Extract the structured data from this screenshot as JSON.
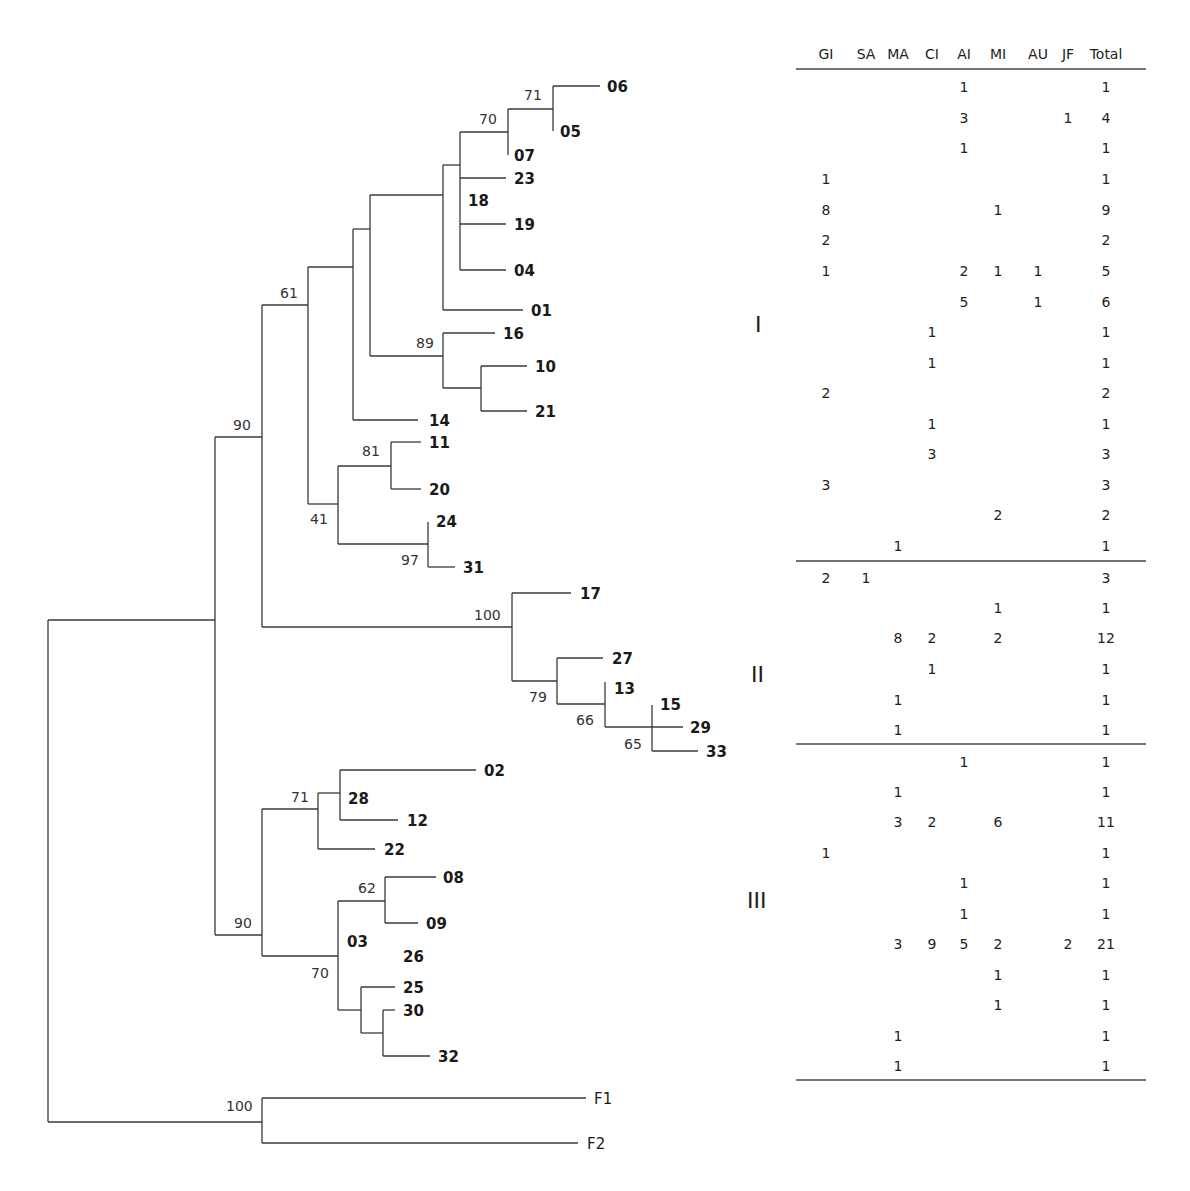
{
  "figure": {
    "type": "phylogenetic-tree-with-distribution-table",
    "table": {
      "columns": [
        "GI",
        "SA",
        "MA",
        "CI",
        "AI",
        "MI",
        "AU",
        "JF",
        "Total"
      ],
      "groups": [
        {
          "label": "I",
          "rows": [
            {
              "tip": "06",
              "GI": "",
              "SA": "",
              "MA": "",
              "CI": "",
              "AI": "1",
              "MI": "",
              "AU": "",
              "JF": "",
              "Total": "1"
            },
            {
              "tip": "05",
              "GI": "",
              "SA": "",
              "MA": "",
              "CI": "",
              "AI": "3",
              "MI": "",
              "AU": "",
              "JF": "1",
              "Total": "4"
            },
            {
              "tip": "07",
              "GI": "",
              "SA": "",
              "MA": "",
              "CI": "",
              "AI": "1",
              "MI": "",
              "AU": "",
              "JF": "",
              "Total": "1"
            },
            {
              "tip": "23",
              "GI": "1",
              "SA": "",
              "MA": "",
              "CI": "",
              "AI": "",
              "MI": "",
              "AU": "",
              "JF": "",
              "Total": "1"
            },
            {
              "tip": "18",
              "GI": "8",
              "SA": "",
              "MA": "",
              "CI": "",
              "AI": "",
              "MI": "1",
              "AU": "",
              "JF": "",
              "Total": "9"
            },
            {
              "tip": "19",
              "GI": "2",
              "SA": "",
              "MA": "",
              "CI": "",
              "AI": "",
              "MI": "",
              "AU": "",
              "JF": "",
              "Total": "2"
            },
            {
              "tip": "04",
              "GI": "1",
              "SA": "",
              "MA": "",
              "CI": "",
              "AI": "2",
              "MI": "1",
              "AU": "1",
              "JF": "",
              "Total": "5"
            },
            {
              "tip": "01",
              "GI": "",
              "SA": "",
              "MA": "",
              "CI": "",
              "AI": "5",
              "MI": "",
              "AU": "1",
              "JF": "",
              "Total": "6"
            },
            {
              "tip": "16",
              "GI": "",
              "SA": "",
              "MA": "",
              "CI": "1",
              "AI": "",
              "MI": "",
              "AU": "",
              "JF": "",
              "Total": "1"
            },
            {
              "tip": "10",
              "GI": "",
              "SA": "",
              "MA": "",
              "CI": "1",
              "AI": "",
              "MI": "",
              "AU": "",
              "JF": "",
              "Total": "1"
            },
            {
              "tip": "21",
              "GI": "2",
              "SA": "",
              "MA": "",
              "CI": "",
              "AI": "",
              "MI": "",
              "AU": "",
              "JF": "",
              "Total": "2"
            },
            {
              "tip": "14",
              "GI": "",
              "SA": "",
              "MA": "",
              "CI": "1",
              "AI": "",
              "MI": "",
              "AU": "",
              "JF": "",
              "Total": "1"
            },
            {
              "tip": "11",
              "GI": "",
              "SA": "",
              "MA": "",
              "CI": "3",
              "AI": "",
              "MI": "",
              "AU": "",
              "JF": "",
              "Total": "3"
            },
            {
              "tip": "20",
              "GI": "3",
              "SA": "",
              "MA": "",
              "CI": "",
              "AI": "",
              "MI": "",
              "AU": "",
              "JF": "",
              "Total": "3"
            },
            {
              "tip": "24",
              "GI": "",
              "SA": "",
              "MA": "",
              "CI": "",
              "AI": "",
              "MI": "2",
              "AU": "",
              "JF": "",
              "Total": "2"
            },
            {
              "tip": "31",
              "GI": "",
              "SA": "",
              "MA": "1",
              "CI": "",
              "AI": "",
              "MI": "",
              "AU": "",
              "JF": "",
              "Total": "1"
            }
          ]
        },
        {
          "label": "II",
          "rows": [
            {
              "tip": "17",
              "GI": "2",
              "SA": "1",
              "MA": "",
              "CI": "",
              "AI": "",
              "MI": "",
              "AU": "",
              "JF": "",
              "Total": "3"
            },
            {
              "tip": "27",
              "GI": "",
              "SA": "",
              "MA": "",
              "CI": "",
              "AI": "",
              "MI": "1",
              "AU": "",
              "JF": "",
              "Total": "1"
            },
            {
              "tip": "13",
              "GI": "",
              "SA": "",
              "MA": "8",
              "CI": "2",
              "AI": "",
              "MI": "2",
              "AU": "",
              "JF": "",
              "Total": "12"
            },
            {
              "tip": "15",
              "GI": "",
              "SA": "",
              "MA": "",
              "CI": "1",
              "AI": "",
              "MI": "",
              "AU": "",
              "JF": "",
              "Total": "1"
            },
            {
              "tip": "29",
              "GI": "",
              "SA": "",
              "MA": "1",
              "CI": "",
              "AI": "",
              "MI": "",
              "AU": "",
              "JF": "",
              "Total": "1"
            },
            {
              "tip": "33",
              "GI": "",
              "SA": "",
              "MA": "1",
              "CI": "",
              "AI": "",
              "MI": "",
              "AU": "",
              "JF": "",
              "Total": "1"
            }
          ]
        },
        {
          "label": "III",
          "rows": [
            {
              "tip": "02",
              "GI": "",
              "SA": "",
              "MA": "",
              "CI": "",
              "AI": "1",
              "MI": "",
              "AU": "",
              "JF": "",
              "Total": "1"
            },
            {
              "tip": "28",
              "GI": "",
              "SA": "",
              "MA": "1",
              "CI": "",
              "AI": "",
              "MI": "",
              "AU": "",
              "JF": "",
              "Total": "1"
            },
            {
              "tip": "12",
              "GI": "",
              "SA": "",
              "MA": "3",
              "CI": "2",
              "AI": "",
              "MI": "6",
              "AU": "",
              "JF": "",
              "Total": "11"
            },
            {
              "tip": "22",
              "GI": "1",
              "SA": "",
              "MA": "",
              "CI": "",
              "AI": "",
              "MI": "",
              "AU": "",
              "JF": "",
              "Total": "1"
            },
            {
              "tip": "08",
              "GI": "",
              "SA": "",
              "MA": "",
              "CI": "",
              "AI": "1",
              "MI": "",
              "AU": "",
              "JF": "",
              "Total": "1"
            },
            {
              "tip": "09",
              "GI": "",
              "SA": "",
              "MA": "",
              "CI": "",
              "AI": "1",
              "MI": "",
              "AU": "",
              "JF": "",
              "Total": "1"
            },
            {
              "tip": "03",
              "GI": "",
              "SA": "",
              "MA": "3",
              "CI": "9",
              "AI": "5",
              "MI": "2",
              "AU": "",
              "JF": "2",
              "Total": "21"
            },
            {
              "tip": "26",
              "GI": "",
              "SA": "",
              "MA": "",
              "CI": "",
              "AI": "",
              "MI": "1",
              "AU": "",
              "JF": "",
              "Total": "1"
            },
            {
              "tip": "25",
              "GI": "",
              "SA": "",
              "MA": "",
              "CI": "",
              "AI": "",
              "MI": "1",
              "AU": "",
              "JF": "",
              "Total": "1"
            },
            {
              "tip": "30",
              "GI": "",
              "SA": "",
              "MA": "1",
              "CI": "",
              "AI": "",
              "MI": "",
              "AU": "",
              "JF": "",
              "Total": "1"
            },
            {
              "tip": "32",
              "GI": "",
              "SA": "",
              "MA": "1",
              "CI": "",
              "AI": "",
              "MI": "",
              "AU": "",
              "JF": "",
              "Total": "1"
            }
          ]
        }
      ]
    },
    "tree": {
      "tips": [
        "06",
        "05",
        "07",
        "23",
        "18",
        "19",
        "04",
        "01",
        "16",
        "10",
        "21",
        "14",
        "11",
        "20",
        "24",
        "31",
        "17",
        "27",
        "13",
        "15",
        "29",
        "33",
        "02",
        "28",
        "12",
        "22",
        "08",
        "09",
        "03",
        "26",
        "25",
        "30",
        "32",
        "F1",
        "F2"
      ],
      "outgroup": [
        "F1",
        "F2"
      ],
      "bootstrap": {
        "n_06_05": "71",
        "n_07_clade": "70",
        "n_16_10_21": "89",
        "n_11_20": "81",
        "n_41": "41",
        "n_24_31": "97",
        "n_61": "61",
        "n_upper_90": "90",
        "n_cladeII": "100",
        "n_79": "79",
        "n_66": "66",
        "n_65": "65",
        "n_28_clade": "71",
        "n_08_09": "62",
        "n_03_clade": "70",
        "n_lower_90": "90",
        "n_outgroup": "100"
      }
    }
  }
}
